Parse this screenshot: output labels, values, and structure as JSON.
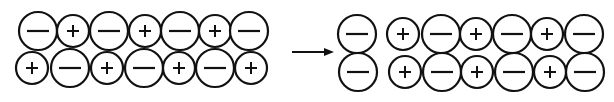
{
  "diagram": {
    "stroke_color": "#111111",
    "background": "#ffffff",
    "large_radius": 19,
    "small_radius": 16,
    "left": {
      "rows": [
        {
          "y": 31,
          "ions": [
            {
              "x": 38,
              "charge": "-"
            },
            {
              "x": 73,
              "charge": "+"
            },
            {
              "x": 109,
              "charge": "-"
            },
            {
              "x": 145,
              "charge": "+"
            },
            {
              "x": 180,
              "charge": "-"
            },
            {
              "x": 215,
              "charge": "+"
            },
            {
              "x": 249,
              "charge": "-"
            }
          ]
        },
        {
          "y": 68,
          "ions": [
            {
              "x": 32,
              "charge": "+"
            },
            {
              "x": 70,
              "charge": "-"
            },
            {
              "x": 107,
              "charge": "+"
            },
            {
              "x": 144,
              "charge": "-"
            },
            {
              "x": 179,
              "charge": "+"
            },
            {
              "x": 215,
              "charge": "-"
            },
            {
              "x": 251,
              "charge": "+"
            }
          ]
        }
      ]
    },
    "arrow": {
      "x1": 292,
      "x2": 334,
      "y": 52
    },
    "right": {
      "rows": [
        {
          "y": 34,
          "ions": [
            {
              "x": 357,
              "charge": "-"
            },
            {
              "x": 403,
              "charge": "+"
            },
            {
              "x": 441,
              "charge": "-"
            },
            {
              "x": 476,
              "charge": "+"
            },
            {
              "x": 512,
              "charge": "-"
            },
            {
              "x": 547,
              "charge": "+"
            },
            {
              "x": 584,
              "charge": "-"
            }
          ]
        },
        {
          "y": 72,
          "ions": [
            {
              "x": 358,
              "charge": "-"
            },
            {
              "x": 405,
              "charge": "+"
            },
            {
              "x": 442,
              "charge": "-"
            },
            {
              "x": 477,
              "charge": "+"
            },
            {
              "x": 514,
              "charge": "-"
            },
            {
              "x": 550,
              "charge": "+"
            },
            {
              "x": 585,
              "charge": "-"
            }
          ]
        }
      ]
    }
  }
}
